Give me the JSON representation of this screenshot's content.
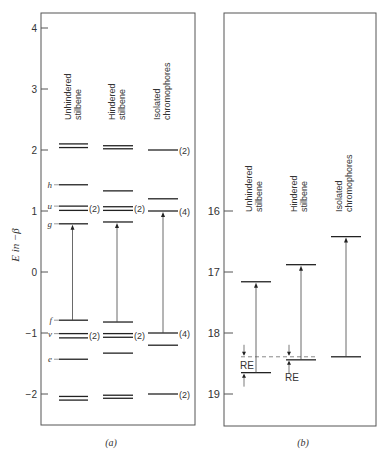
{
  "chart_data": [
    {
      "type": "energy-level-diagram",
      "panel_label": "(a)",
      "ylabel": "E in −β",
      "yticks": [
        4,
        3,
        2,
        1,
        0,
        -1,
        -2
      ],
      "ylim": [
        -2.5,
        4.25
      ],
      "columns": [
        {
          "name": "Unhindered stilbene",
          "label_lines": [
            "Unhindered",
            "stilbene"
          ],
          "levels": [
            {
              "E": 2.1
            },
            {
              "E": 2.04
            },
            {
              "E": 1.43,
              "label": "h"
            },
            {
              "E": 1.08,
              "label": "u"
            },
            {
              "E": 1.01
            },
            {
              "E": 0.79,
              "label": "g"
            },
            {
              "E": -0.79,
              "label": "f"
            },
            {
              "E": -1.01,
              "label": "v"
            },
            {
              "E": -1.08
            },
            {
              "E": -1.43,
              "label": "e"
            },
            {
              "E": -2.04
            },
            {
              "E": -2.1
            }
          ],
          "degeneracy_marks": [
            {
              "E": 1.04,
              "text": "(2)"
            },
            {
              "E": -1.04,
              "text": "(2)"
            }
          ],
          "transition": {
            "from": -0.79,
            "to": 0.79
          }
        },
        {
          "name": "Hindered stilbene",
          "label_lines": [
            "Hindered",
            "stilbene"
          ],
          "levels": [
            {
              "E": 2.07
            },
            {
              "E": 2.02
            },
            {
              "E": 1.33
            },
            {
              "E": 1.07
            },
            {
              "E": 1.01
            },
            {
              "E": 0.82
            },
            {
              "E": -0.82
            },
            {
              "E": -1.01
            },
            {
              "E": -1.07
            },
            {
              "E": -1.33
            },
            {
              "E": -2.02
            },
            {
              "E": -2.07
            }
          ],
          "degeneracy_marks": [
            {
              "E": 1.04,
              "text": "(2)"
            },
            {
              "E": -1.04,
              "text": "(2)"
            }
          ],
          "transition": {
            "from": -0.82,
            "to": 0.82
          }
        },
        {
          "name": "Isolated chromophores",
          "label_lines": [
            "Isolated",
            "chromophores"
          ],
          "levels": [
            {
              "E": 2.0
            },
            {
              "E": 1.2
            },
            {
              "E": 1.0
            },
            {
              "E": -1.0
            },
            {
              "E": -1.2
            },
            {
              "E": -2.0
            }
          ],
          "degeneracy_marks": [
            {
              "E": 2.0,
              "text": "(2)"
            },
            {
              "E": 1.0,
              "text": "(4)"
            },
            {
              "E": -1.0,
              "text": "(4)"
            },
            {
              "E": -2.0,
              "text": "(2)"
            }
          ],
          "transition": {
            "from": -1.0,
            "to": 1.0
          }
        }
      ]
    },
    {
      "type": "energy-level-diagram",
      "panel_label": "(b)",
      "ylabel": "",
      "yticks": [
        16,
        17,
        18,
        19
      ],
      "ylim": [
        15.99,
        19.5
      ],
      "columns": [
        {
          "name": "Unhindered stilbene",
          "label_lines": [
            "Unhindered",
            "stilbene"
          ],
          "upper": 17.16,
          "lower": 18.65,
          "re_label": "RE"
        },
        {
          "name": "Hindered stilbene",
          "label_lines": [
            "Hindered",
            "stilbene"
          ],
          "upper": 16.88,
          "lower": 18.44,
          "re_label": "RE"
        },
        {
          "name": "Isolated chromophores",
          "label_lines": [
            "Isolated",
            "chromophores"
          ],
          "upper": 16.42,
          "lower": 18.39
        }
      ],
      "reference_dashed": 18.39
    }
  ]
}
